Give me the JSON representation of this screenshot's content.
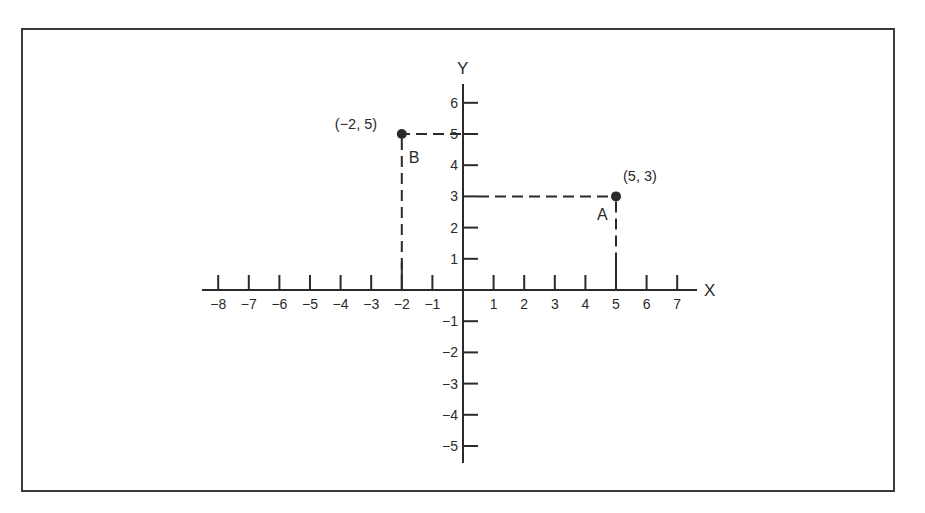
{
  "diagram": {
    "type": "coordinate-plane",
    "axes": {
      "x_label": "X",
      "y_label": "Y",
      "x_ticks": [
        -8,
        -7,
        -6,
        -5,
        -4,
        -3,
        -2,
        -1,
        1,
        2,
        3,
        4,
        5,
        6,
        7
      ],
      "y_ticks": [
        6,
        5,
        4,
        3,
        2,
        1,
        -1,
        -2,
        -3,
        -4,
        -5
      ],
      "x_range": [
        -8,
        7
      ],
      "y_range": [
        -5,
        6
      ]
    },
    "points": [
      {
        "name": "A",
        "x": 5,
        "y": 3,
        "coord_label": "(5, 3)"
      },
      {
        "name": "B",
        "x": -2,
        "y": 5,
        "coord_label": "(−2, 5)"
      }
    ],
    "projection_lines": "dashed",
    "colors": {
      "ink": "#2a2a2a",
      "frame": "#3a3a3a",
      "background": "#ffffff"
    }
  }
}
